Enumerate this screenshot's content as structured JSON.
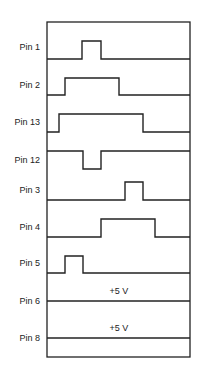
{
  "diagram": {
    "type": "timing-diagram",
    "frame": {
      "x1": 47,
      "y1": 22,
      "x2": 190,
      "y2": 357
    },
    "signals": [
      {
        "label": "Pin 1",
        "label_y": 50,
        "high_y": 41,
        "low_y": 59,
        "baseline": "low",
        "pulses": [
          [
            82,
            101
          ]
        ]
      },
      {
        "label": "Pin 2",
        "label_y": 88,
        "high_y": 78,
        "low_y": 95,
        "baseline": "low",
        "pulses": [
          [
            65,
            119
          ]
        ]
      },
      {
        "label": "Pin 13",
        "label_y": 125,
        "high_y": 114,
        "low_y": 132,
        "baseline": "low",
        "pulses": [
          [
            59,
            143
          ]
        ]
      },
      {
        "label": "Pin 12",
        "label_y": 163,
        "high_y": 151,
        "low_y": 169,
        "baseline": "high",
        "pulses": [
          [
            83,
            101
          ]
        ]
      },
      {
        "label": "Pin 3",
        "label_y": 193,
        "high_y": 182,
        "low_y": 200,
        "baseline": "low",
        "pulses": [
          [
            125,
            143
          ]
        ]
      },
      {
        "label": "Pin 4",
        "label_y": 230,
        "high_y": 219,
        "low_y": 237,
        "baseline": "low",
        "pulses": [
          [
            101,
            155
          ]
        ]
      },
      {
        "label": "Pin 5",
        "label_y": 266,
        "high_y": 256,
        "low_y": 273,
        "baseline": "low",
        "pulses": [
          [
            65,
            83
          ]
        ]
      },
      {
        "label": "Pin 6",
        "label_y": 304,
        "level_y": 301,
        "baseline": "constant",
        "annotation": "+5 V",
        "annotation_y": 294
      },
      {
        "label": "Pin 8",
        "label_y": 341,
        "level_y": 338,
        "baseline": "constant",
        "annotation": "+5 V",
        "annotation_y": 331
      }
    ]
  }
}
